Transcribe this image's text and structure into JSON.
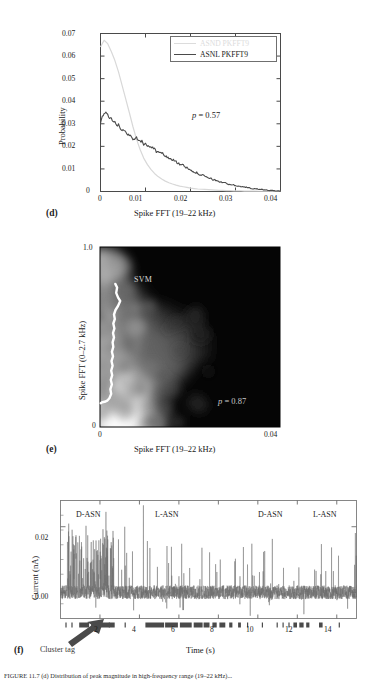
{
  "figure": {
    "caption": "FIGURE 11.7 (d) Distribution of peak magnitude in high-frequency range (19–22 kHz)..."
  },
  "panel_d": {
    "letter": "(d)",
    "xlabel": "Spike FFT (19–22 kHz)",
    "ylabel": "Probability",
    "xticks": [
      "0",
      "0.01",
      "0.02",
      "0.03",
      "0.04"
    ],
    "yticks": [
      "0",
      "0.01",
      "0.02",
      "0.03",
      "0.04",
      "0.05",
      "0.06",
      "0.07"
    ],
    "pvalue_prefix": "p",
    "pvalue_text": " = 0.57",
    "legend": [
      {
        "label": "ASND PKFFT9",
        "color": "#d8d8d8"
      },
      {
        "label": "ASNL PKFFT9",
        "color": "#4a4a4a"
      }
    ]
  },
  "chart_data": [
    {
      "type": "line",
      "title": "",
      "panel": "(d)",
      "xlabel": "Spike FFT (19–22 kHz)",
      "ylabel": "Probability",
      "xlim": [
        0,
        0.04
      ],
      "ylim": [
        0,
        0.07
      ],
      "grid": false,
      "legend_position": "top-right",
      "annotation": "p = 0.57",
      "x": [
        0.0,
        0.0008,
        0.0016,
        0.0024,
        0.0032,
        0.004,
        0.0048,
        0.0056,
        0.0064,
        0.0072,
        0.008,
        0.0088,
        0.0096,
        0.0104,
        0.0112,
        0.012,
        0.0128,
        0.0136,
        0.0144,
        0.0152,
        0.016,
        0.0168,
        0.0176,
        0.0184,
        0.0192,
        0.02,
        0.0208,
        0.0216,
        0.0224,
        0.0232,
        0.024,
        0.0248,
        0.0256,
        0.0264,
        0.0272,
        0.028,
        0.0288,
        0.0296,
        0.0304,
        0.0312,
        0.032,
        0.0328,
        0.0336,
        0.0344,
        0.0352,
        0.036,
        0.0368,
        0.0376,
        0.0384,
        0.0392,
        0.04
      ],
      "series": [
        {
          "name": "ASND PKFFT9",
          "color": "#d8d8d8",
          "values": [
            0.064,
            0.067,
            0.0655,
            0.062,
            0.058,
            0.053,
            0.047,
            0.041,
            0.035,
            0.0288,
            0.0232,
            0.0186,
            0.0148,
            0.012,
            0.0098,
            0.008,
            0.0066,
            0.0055,
            0.0046,
            0.0039,
            0.0033,
            0.0028,
            0.0024,
            0.0021,
            0.0018,
            0.0015,
            0.0013,
            0.0011,
            0.001,
            0.0009,
            0.0008,
            0.0007,
            0.0006,
            0.0005,
            0.0005,
            0.0004,
            0.0004,
            0.0003,
            0.0003,
            0.0003,
            0.0002,
            0.0002,
            0.0002,
            0.0002,
            0.0001,
            0.0001,
            0.0001,
            0.0001,
            0.0001,
            0.0001,
            0.0001
          ]
        },
        {
          "name": "ASNL PKFFT9",
          "color": "#4a4a4a",
          "values": [
            0.03,
            0.0352,
            0.034,
            0.032,
            0.0305,
            0.0292,
            0.0272,
            0.0262,
            0.0248,
            0.0236,
            0.024,
            0.0228,
            0.0212,
            0.0205,
            0.0198,
            0.0186,
            0.0172,
            0.017,
            0.0158,
            0.015,
            0.014,
            0.0132,
            0.0122,
            0.0114,
            0.0104,
            0.0098,
            0.0088,
            0.008,
            0.0074,
            0.0066,
            0.006,
            0.0054,
            0.005,
            0.0044,
            0.004,
            0.0035,
            0.0032,
            0.0028,
            0.0025,
            0.0022,
            0.0019,
            0.0017,
            0.0014,
            0.0012,
            0.001,
            0.0008,
            0.0007,
            0.0005,
            0.0004,
            0.0003,
            0.0002
          ]
        }
      ]
    },
    {
      "type": "heatmap",
      "panel": "(e)",
      "xlabel": "Spike FFT (19–22 kHz)",
      "ylabel": "Spike FFT (0–2.7 kHz)",
      "xlim": [
        0,
        0.04
      ],
      "ylim": [
        0,
        1.0
      ],
      "xticks": [
        "0",
        "0.04"
      ],
      "yticks": [
        "0",
        "1.0"
      ],
      "annotation": "p = 0.87",
      "boundary_label": "SVM",
      "colormap": "grayscale",
      "description": "2D density of spike FFT low vs high band with white SVM decision boundary near left edge"
    },
    {
      "type": "line",
      "panel": "(f)",
      "xlabel": "Time (s)",
      "ylabel": "Current (nA)",
      "xlim": [
        0,
        15
      ],
      "ylim": [
        -0.008,
        0.028
      ],
      "xticks": [
        "2",
        "4",
        "6",
        "8",
        "10",
        "12",
        "14"
      ],
      "yticks": [
        "0.00",
        "0.02"
      ],
      "segments": [
        {
          "label": "D-ASN",
          "t_start": 0.3,
          "t_end": 2.8
        },
        {
          "label": "L-ASN",
          "t_start": 4.2,
          "t_end": 7.2
        },
        {
          "label": "D-ASN",
          "t_start": 10.8,
          "t_end": 12.9
        },
        {
          "label": "L-ASN",
          "t_start": 13.4,
          "t_end": 14.8
        }
      ],
      "description": "Nanopore current trace with downward/upward spikes; cluster tag bar beneath axis"
    }
  ],
  "panel_e": {
    "letter": "(e)",
    "xlabel": "Spike FFT (19–22 kHz)",
    "ylabel": "Spike FFT (0–2.7 kHz)",
    "xticks": [
      "0",
      "0.04"
    ],
    "yticks": [
      "0",
      "1.0"
    ],
    "pvalue_prefix": "p",
    "pvalue_text": " = 0.87",
    "svm_label": "SVM"
  },
  "panel_f": {
    "letter": "(f)",
    "xlabel": "Time (s)",
    "ylabel": "Current (nA)",
    "xticks": [
      "2",
      "4",
      "6",
      "8",
      "10",
      "12",
      "14"
    ],
    "yticks": [
      "0.00",
      "0.02"
    ],
    "cluster_tag_label": "Cluster tag",
    "trace_labels": [
      "D-ASN",
      "L-ASN",
      "D-ASN",
      "L-ASN"
    ]
  },
  "colors": {
    "light_series": "#d8d8d8",
    "dark_series": "#4a4a4a",
    "axis": "#4a4a4a",
    "svm": "#ffffff",
    "trace": "#5a5a5a"
  }
}
